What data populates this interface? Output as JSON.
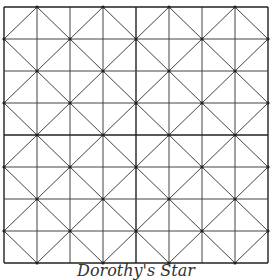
{
  "figure": {
    "caption": "Dorothy's Star",
    "grid": {
      "rows": 8,
      "cols": 8,
      "left": 4,
      "top": 7,
      "width": 264,
      "height": 256,
      "line_color": "#444444",
      "major_line_color": "#222222",
      "diagonal_pitch_cells": 2
    }
  }
}
